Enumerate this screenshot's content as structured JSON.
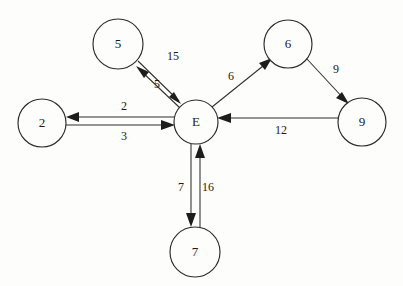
{
  "diagram": {
    "background_color": "#fdfdfb",
    "stroke_color": "#2f2f2f",
    "nodes": [
      {
        "id": "E",
        "label": "E",
        "cx": 196,
        "cy": 122,
        "r": 22
      },
      {
        "id": "n5",
        "label": "5",
        "cx": 118,
        "cy": 44,
        "r": 25
      },
      {
        "id": "n2",
        "label": "2",
        "cx": 42,
        "cy": 123,
        "r": 24
      },
      {
        "id": "n6",
        "label": "6",
        "cx": 288,
        "cy": 44,
        "r": 24
      },
      {
        "id": "n9",
        "label": "9",
        "cx": 362,
        "cy": 122,
        "r": 24
      },
      {
        "id": "n7",
        "label": "7",
        "cx": 195,
        "cy": 252,
        "r": 25
      }
    ],
    "edges": [
      {
        "id": "e-5-to-E",
        "from": "5",
        "to": "E",
        "weight": "15",
        "label_x": 173,
        "label_y": 57
      },
      {
        "id": "e-E-to-5",
        "from": "E",
        "to": "5",
        "weight": "5",
        "label_x": 157,
        "label_y": 85
      },
      {
        "id": "e-E-to-2",
        "from": "E",
        "to": "2",
        "weight": "2",
        "label_x": 124,
        "label_y": 107
      },
      {
        "id": "e-2-to-E",
        "from": "2",
        "to": "E",
        "weight": "3",
        "label_x": 124,
        "label_y": 137
      },
      {
        "id": "e-E-to-6",
        "from": "E",
        "to": "6",
        "weight": "6",
        "label_x": 231,
        "label_y": 77
      },
      {
        "id": "e-6-to-9",
        "from": "6",
        "to": "9",
        "weight": "9",
        "label_x": 336,
        "label_y": 70
      },
      {
        "id": "e-9-to-E",
        "from": "9",
        "to": "E",
        "weight": "12",
        "label_x": 281,
        "label_y": 131
      },
      {
        "id": "e-E-to-7",
        "from": "E",
        "to": "7",
        "weight": "7",
        "label_x": 181,
        "label_y": 188
      },
      {
        "id": "e-7-to-E",
        "from": "7",
        "to": "E",
        "weight": "16",
        "label_x": 208,
        "label_y": 188
      }
    ]
  }
}
